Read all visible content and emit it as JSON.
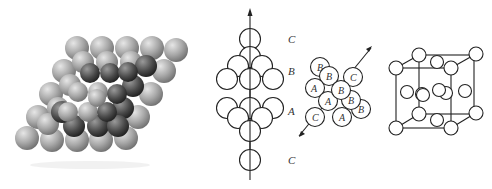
{
  "figure": {
    "panels": [
      {
        "id": "sphere-packing-3d",
        "description": "3D close-packed sphere stack (shaded grey spheres)"
      },
      {
        "id": "layer-stack-side",
        "description": "Side view of close-packed layer stacking along axis",
        "labels": [
          "C",
          "B",
          "A",
          "C"
        ]
      },
      {
        "id": "abc-packing-view",
        "description": "View along stacking direction showing A, B, C positions",
        "labels": [
          "B",
          "B",
          "C",
          "A",
          "B",
          "A",
          "B",
          "C",
          "A",
          "B"
        ]
      },
      {
        "id": "fcc-unit-cell",
        "description": "Face-centered cubic unit cell with corner and face atoms"
      }
    ],
    "stack_labels": {
      "top": "C",
      "upper": "B",
      "middle": "A",
      "bottom": "C"
    },
    "abc_labels": {
      "l1": "B",
      "l2": "B",
      "l3": "C",
      "l4": "A",
      "l5": "B",
      "l6": "A",
      "l7": "B",
      "l8": "C",
      "l9": "A",
      "l10": "B"
    },
    "colors": {
      "line": "#222222",
      "sphere_light": "#c8c8c8",
      "sphere_dark": "#3a3a3a",
      "background": "#ffffff"
    }
  }
}
